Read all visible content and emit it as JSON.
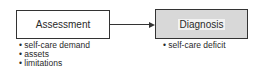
{
  "nodes": [
    {
      "id": "assessment",
      "label": "Assessment",
      "bullets": [
        "self-care demand",
        "assets",
        "limitations"
      ]
    },
    {
      "id": "diagnosis",
      "label": "Diagnosis",
      "bullets": [
        "self-care deficit"
      ]
    }
  ],
  "edges": [
    {
      "from": "assessment",
      "to": "diagnosis",
      "style": "arrow"
    }
  ]
}
